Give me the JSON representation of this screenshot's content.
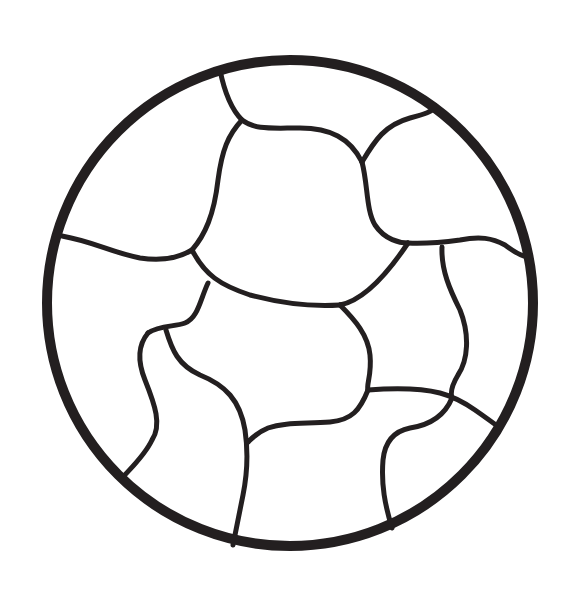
{
  "drawing": {
    "subject": "ball outline with curved panel seams (coloring page)",
    "stroke_color": "#231f20",
    "background_color": "#ffffff",
    "outer_circle": {
      "cx": 290,
      "cy": 303,
      "r": 243,
      "stroke_width": 10
    },
    "seam_stroke_width": 5,
    "panel_count_visible": 13
  }
}
